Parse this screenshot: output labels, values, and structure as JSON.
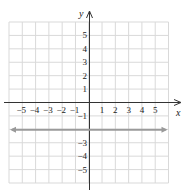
{
  "chart_data": {
    "type": "line",
    "title": "",
    "xlabel": "x",
    "ylabel": "y",
    "xlim": [
      -6,
      6
    ],
    "ylim": [
      -6,
      6
    ],
    "grid": true,
    "x_tick_labels": [
      "-5",
      "-4",
      "-3",
      "-2",
      "-1",
      "1",
      "2",
      "3",
      "4",
      "5"
    ],
    "y_tick_labels": [
      "5",
      "4",
      "3",
      "2",
      "1",
      "-1",
      "-3",
      "-4",
      "-5"
    ],
    "series": [
      {
        "name": "y = -2",
        "kind": "horizontal-line",
        "y": -2,
        "x": [
          -6,
          6
        ],
        "values": [
          -2,
          -2
        ],
        "arrows": "both",
        "color": "#9a9a9a"
      }
    ]
  },
  "labels": {
    "x_axis": "x",
    "y_axis": "y"
  },
  "colors": {
    "grid": "#d9d9d9",
    "axis": "#333333",
    "line": "#9a9a9a"
  }
}
